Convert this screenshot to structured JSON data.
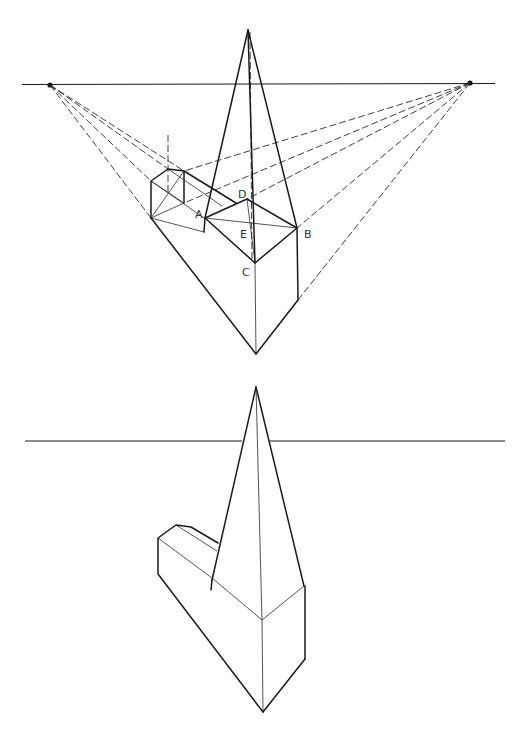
{
  "figure": {
    "top_panel": {
      "labels": {
        "A": "A",
        "B": "B",
        "C": "C",
        "D": "D",
        "E": "E"
      },
      "horizon_line": {
        "y": 84,
        "x_start": 22,
        "x_end": 495
      },
      "vanishing_points": [
        {
          "name": "left-vp",
          "x": 50,
          "y": 85
        },
        {
          "name": "right-vp",
          "x": 470,
          "y": 83
        }
      ]
    },
    "bottom_panel": {
      "horizon_line": {
        "y": 441,
        "x_start": 25,
        "x_end": 505
      }
    },
    "colors": {
      "line": "#1a1a1a",
      "label": "#333333",
      "background": "#ffffff"
    }
  }
}
